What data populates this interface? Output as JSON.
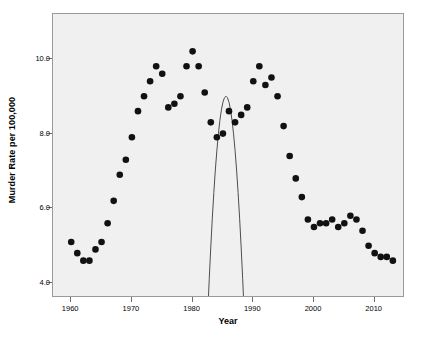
{
  "chart_data": {
    "type": "scatter",
    "title": "",
    "xlabel": "Year",
    "ylabel": "Murder Rate per 100,000",
    "xlim": [
      1957,
      2015
    ],
    "ylim": [
      3.6,
      11.2
    ],
    "grid": false,
    "legend": null,
    "xticks": [
      1960,
      1970,
      1980,
      1990,
      2000,
      2010
    ],
    "xtick_labels": [
      "1960",
      "1970",
      "1980",
      "1990",
      "2000",
      "2010"
    ],
    "yticks": [
      4.0,
      6.0,
      8.0,
      10.0
    ],
    "ytick_labels": [
      "4.0",
      "6.0",
      "8.0",
      "10.0"
    ],
    "marker_color": "#111111",
    "marker_size": 4.6,
    "fit_color": "#4d4d4d",
    "plot_background": "#f0f0f0",
    "frame_color": "#9a9a9a",
    "x": [
      1960,
      1961,
      1962,
      1963,
      1964,
      1965,
      1966,
      1967,
      1968,
      1969,
      1970,
      1971,
      1972,
      1973,
      1974,
      1975,
      1976,
      1977,
      1978,
      1979,
      1980,
      1981,
      1982,
      1983,
      1984,
      1985,
      1986,
      1987,
      1988,
      1989,
      1990,
      1991,
      1992,
      1993,
      1994,
      1995,
      1996,
      1997,
      1998,
      1999,
      2000,
      2001,
      2002,
      2003,
      2004,
      2005,
      2006,
      2007,
      2008,
      2009,
      2010,
      2011,
      2012,
      2013
    ],
    "y": [
      5.1,
      4.8,
      4.6,
      4.6,
      4.9,
      5.1,
      5.6,
      6.2,
      6.9,
      7.3,
      7.9,
      8.6,
      9.0,
      9.4,
      9.8,
      9.6,
      8.7,
      8.8,
      9.0,
      9.8,
      10.2,
      9.8,
      9.1,
      8.3,
      7.9,
      8.0,
      8.6,
      8.3,
      8.5,
      8.7,
      9.4,
      9.8,
      9.3,
      9.5,
      9.0,
      8.2,
      7.4,
      6.8,
      6.3,
      5.7,
      5.5,
      5.6,
      5.6,
      5.7,
      5.5,
      5.6,
      5.8,
      5.7,
      5.4,
      5.0,
      4.8,
      4.7,
      4.7,
      4.6
    ],
    "fit": {
      "type": "quadratic",
      "description": "Quadratic regression curve",
      "vertex_year": 1985.5,
      "vertex_value": 9.0,
      "curvature": -0.00645
    }
  },
  "axes": {
    "y_title": "Murder Rate per 100,000",
    "x_title": "Year"
  }
}
